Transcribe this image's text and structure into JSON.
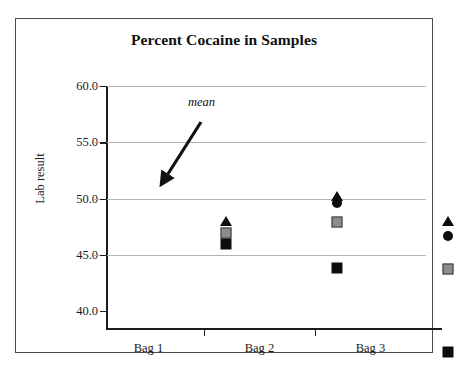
{
  "figure": {
    "title": "Percent Cocaine in Samples"
  },
  "chart_data": {
    "type": "scatter",
    "title": "Percent Cocaine in Samples",
    "xlabel": "",
    "ylabel": "Lab result",
    "ylim": [
      40.0,
      60.0
    ],
    "ytick_labels": [
      "60.0",
      "55.0",
      "50.0",
      "45.0",
      "40.0"
    ],
    "ytick_values": [
      60.0,
      55.0,
      50.0,
      45.0,
      40.0
    ],
    "grid": "horizontal",
    "legend": "none",
    "categories": [
      "Bag 1",
      "Bag 2",
      "Bag 3"
    ],
    "annotations": [
      {
        "text": "mean",
        "points_to": "gray-square-marker",
        "style": "italic-with-arrow"
      }
    ],
    "series": [
      {
        "name": "triangle",
        "marker": "triangle",
        "color": "#0d0d0d",
        "values": [
          54.0,
          56.2,
          54.0
        ]
      },
      {
        "name": "circle",
        "marker": "circle",
        "color": "#0d0d0d",
        "values": [
          null,
          55.6,
          52.6
        ]
      },
      {
        "name": "mean",
        "marker": "square",
        "color": "#8c8c8c",
        "values": [
          52.9,
          53.9,
          49.7
        ]
      },
      {
        "name": "square",
        "marker": "square",
        "color": "#0d0d0d",
        "values": [
          51.9,
          49.8,
          42.3
        ]
      }
    ]
  },
  "axes": {
    "y_title": "Lab result",
    "y_ticks": [
      {
        "label": "60.0",
        "value": 60.0
      },
      {
        "label": "55.0",
        "value": 55.0
      },
      {
        "label": "50.0",
        "value": 50.0
      },
      {
        "label": "45.0",
        "value": 45.0
      },
      {
        "label": "40.0",
        "value": 40.0
      }
    ],
    "x_ticks": [
      {
        "label": "Bag 1"
      },
      {
        "label": "Bag 2"
      },
      {
        "label": "Bag 3"
      }
    ]
  },
  "annotation": {
    "mean_label": "mean"
  },
  "colors": {
    "marker_black": "#0d0d0d",
    "marker_gray": "#8c8c8c",
    "gridline": "#b4b4b4",
    "axis": "#1c1c1c",
    "frame": "#4a4a4a"
  }
}
